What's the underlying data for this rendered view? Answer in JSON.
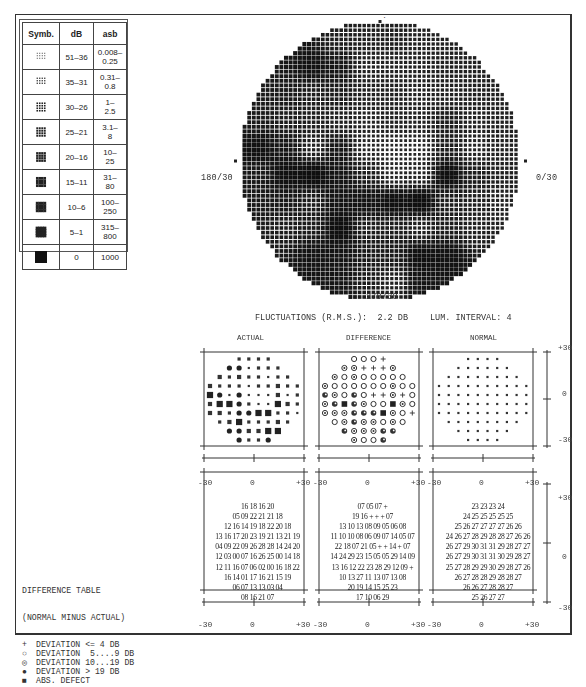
{
  "legend": {
    "headers": [
      "Symb.",
      "dB",
      "asb"
    ],
    "rows": [
      {
        "level": 1,
        "db": "51–36",
        "asb": "0.008–\n0.25"
      },
      {
        "level": 2,
        "db": "35–31",
        "asb": "0.31–\n0.8"
      },
      {
        "level": 3,
        "db": "30–26",
        "asb": "1–\n2.5"
      },
      {
        "level": 4,
        "db": "25–21",
        "asb": "3.1–\n8"
      },
      {
        "level": 5,
        "db": "20–16",
        "asb": "10–\n25"
      },
      {
        "level": 6,
        "db": "15–11",
        "asb": "31–\n80"
      },
      {
        "level": 7,
        "db": "10–6",
        "asb": "100–\n250"
      },
      {
        "level": 8,
        "db": "5–1",
        "asb": "315–\n800"
      },
      {
        "level": 9,
        "db": "0",
        "asb": "1000"
      }
    ]
  },
  "field": {
    "label_top": "90/30",
    "label_bottom": "270/30",
    "label_left": "180/30",
    "label_right": "0/30"
  },
  "info": {
    "fluctuations": "FLUCTUATIONS (R.M.S.):  2.2 DB",
    "lum_interval": "LUM. INTERVAL: 4"
  },
  "plots": {
    "actual_title": "ACTUAL",
    "difference_title": "DIFFERENCE",
    "normal_title": "NORMAL",
    "x_ticks": [
      "-30",
      "0",
      "+30"
    ],
    "y_ticks": [
      "+30",
      "0",
      "-30"
    ]
  },
  "difference_legend": {
    "title": "DIFFERENCE TABLE",
    "subtitle": "(NORMAL MINUS ACTUAL)",
    "items": [
      {
        "symbol": "+",
        "label": "DEVIATION <= 4 DB"
      },
      {
        "symbol": "o",
        "label": "DEVIATION  5....9 DB"
      },
      {
        "symbol": "ring",
        "label": "DEVIATION 10...19 DB"
      },
      {
        "symbol": "half",
        "label": "DEVIATION > 19 DB"
      },
      {
        "symbol": "square",
        "label": "ABS. DEFECT"
      }
    ]
  },
  "chart_data": {
    "type": "table",
    "subtitle": "FLUCTUATIONS (R.M.S.): 2.2 DB   LUM. INTERVAL: 4",
    "axes": {
      "x_ticks": [
        -30,
        0,
        30
      ],
      "y_ticks": [
        30,
        0,
        -30
      ],
      "xlabel": "degrees",
      "ylabel": "degrees"
    },
    "grid_row_lengths": [
      4,
      6,
      8,
      10,
      10,
      10,
      10,
      8,
      6,
      4
    ],
    "actual_db": [
      [
        16,
        18,
        16,
        20
      ],
      [
        5,
        9,
        22,
        21,
        21,
        18
      ],
      [
        12,
        16,
        14,
        19,
        18,
        22,
        20,
        18
      ],
      [
        13,
        16,
        17,
        20,
        23,
        19,
        21,
        13,
        21,
        19
      ],
      [
        4,
        9,
        22,
        9,
        26,
        28,
        28,
        14,
        24,
        20
      ],
      [
        12,
        3,
        0,
        7,
        16,
        26,
        25,
        0,
        14,
        18
      ],
      [
        12,
        11,
        16,
        7,
        6,
        2,
        0,
        16,
        18,
        22
      ],
      [
        16,
        14,
        1,
        17,
        16,
        21,
        15,
        19
      ],
      [
        6,
        7,
        13,
        13,
        3,
        4
      ],
      [
        8,
        16,
        21,
        7
      ]
    ],
    "difference_db": [
      [
        "07",
        "05",
        "07",
        "+"
      ],
      [
        "19",
        "16",
        "+",
        "+",
        "+",
        "07"
      ],
      [
        "13",
        "10",
        "13",
        "08",
        "09",
        "05",
        "06",
        "08"
      ],
      [
        "11",
        "10",
        "10",
        "08",
        "06",
        "09",
        "07",
        "14",
        "05",
        "07"
      ],
      [
        "22",
        "18",
        "07",
        "21",
        "05",
        "+",
        "+",
        "14",
        "+",
        "07"
      ],
      [
        "14",
        "24",
        "29",
        "23",
        "15",
        "05",
        "05",
        "29",
        "14",
        "09"
      ],
      [
        "13",
        "16",
        "12",
        "22",
        "23",
        "28",
        "29",
        "12",
        "09",
        "+"
      ],
      [
        "10",
        "13",
        "27",
        "11",
        "13",
        "07",
        "13",
        "08"
      ],
      [
        "20",
        "19",
        "14",
        "15",
        "25",
        "23"
      ],
      [
        "17",
        "10",
        "06",
        "29"
      ]
    ],
    "normal_db": [
      [
        23,
        23,
        23,
        24
      ],
      [
        24,
        25,
        25,
        25,
        25,
        25
      ],
      [
        25,
        26,
        27,
        27,
        27,
        27,
        26,
        26
      ],
      [
        24,
        26,
        27,
        28,
        29,
        28,
        28,
        27,
        26,
        26
      ],
      [
        26,
        27,
        29,
        30,
        31,
        31,
        29,
        28,
        27,
        27
      ],
      [
        26,
        27,
        29,
        30,
        31,
        31,
        30,
        29,
        28,
        27
      ],
      [
        25,
        27,
        28,
        29,
        29,
        30,
        29,
        28,
        27,
        26
      ],
      [
        26,
        27,
        28,
        28,
        29,
        28,
        28,
        27
      ],
      [
        26,
        26,
        27,
        28,
        28,
        27
      ],
      [
        25,
        26,
        27,
        27
      ]
    ],
    "difference_symbols": [
      [
        "o",
        "o",
        "o",
        "+"
      ],
      [
        "ring",
        "ring",
        "+",
        "+",
        "+",
        "ring"
      ],
      [
        "ring",
        "o",
        "ring",
        "o",
        "o",
        "o",
        "o",
        "o"
      ],
      [
        "ring",
        "o",
        "o",
        "o",
        "o",
        "o",
        "o",
        "ring",
        "o",
        "o"
      ],
      [
        "half",
        "ring",
        "o",
        "half",
        "o",
        "+",
        "+",
        "ring",
        "+",
        "o"
      ],
      [
        "ring",
        "half",
        "sq",
        "half",
        "ring",
        "o",
        "o",
        "sq",
        "ring",
        "o"
      ],
      [
        "ring",
        "ring",
        "ring",
        "half",
        "half",
        "half",
        "sq",
        "ring",
        "o",
        "+"
      ],
      [
        "o",
        "ring",
        "half",
        "ring",
        "ring",
        "o",
        "ring",
        "o"
      ],
      [
        "half",
        "ring",
        "ring",
        "ring",
        "half",
        "half"
      ],
      [
        "ring",
        "o",
        "o",
        "half"
      ]
    ]
  }
}
